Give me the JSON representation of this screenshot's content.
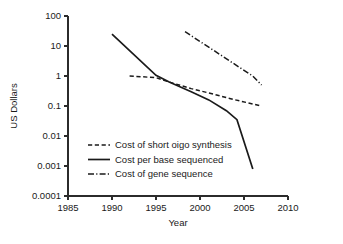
{
  "chart_data": {
    "type": "line",
    "title": "",
    "xlabel": "Year",
    "ylabel": "US Dollars",
    "yscale": "log",
    "xlim": [
      1985,
      2010
    ],
    "ylim": [
      0.0001,
      100
    ],
    "grid": false,
    "legend_position": "center-left-inside",
    "xticks": [
      1985,
      1990,
      1995,
      2000,
      2005,
      2010
    ],
    "xtick_labels": [
      "1985",
      "1990",
      "1995",
      "2000",
      "2005",
      "2010"
    ],
    "yticks": [
      100,
      10,
      1,
      0.1,
      0.01,
      0.001,
      0.0001
    ],
    "ytick_labels": [
      "100",
      "10",
      "1",
      "0.1",
      "0.01",
      "0.001",
      "0.0001"
    ],
    "series": [
      {
        "name": "Cost of short oigo synthesis",
        "style": "dashed",
        "x": [
          1992,
          1995,
          1996.5,
          1999,
          2001.5,
          2004,
          2007
        ],
        "values": [
          1.0,
          0.88,
          0.63,
          0.38,
          0.25,
          0.16,
          0.1
        ]
      },
      {
        "name": "Cost per base sequenced",
        "style": "solid",
        "x": [
          1990,
          1995,
          1996.5,
          1999,
          2001,
          2003,
          2004.2,
          2006
        ],
        "values": [
          25,
          1.05,
          0.63,
          0.3,
          0.16,
          0.07,
          0.035,
          0.0008
        ]
      },
      {
        "name": "Cost of gene sequence",
        "style": "dashdot",
        "x": [
          1998.3,
          2001.6,
          2004.3,
          2006,
          2007
        ],
        "values": [
          30,
          7.0,
          2.1,
          1.0,
          0.5
        ]
      }
    ]
  },
  "legend": {
    "items": [
      {
        "label": "Cost of short oigo synthesis",
        "style": "dashed"
      },
      {
        "label": "Cost per base sequenced",
        "style": "solid"
      },
      {
        "label": "Cost of gene sequence",
        "style": "dashdot"
      }
    ]
  },
  "colors": {
    "ink": "#1a1a1a",
    "axis": "#2b2b2b",
    "background": "#ffffff"
  }
}
